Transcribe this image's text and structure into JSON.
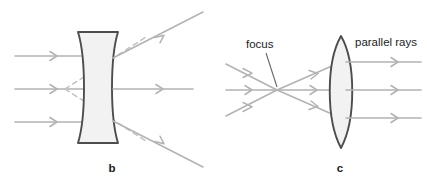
{
  "figure": {
    "width": 427,
    "height": 183,
    "background": "#ffffff"
  },
  "colors": {
    "ray": "#b3b3b3",
    "virtual_ray": "#c2c2c2",
    "lens_outline": "#4d4d4d",
    "lens_fill": "#f2f2f2",
    "leader": "#666666",
    "text": "#222222"
  },
  "panels": [
    {
      "id": "b",
      "letter": "b",
      "letter_x": 112,
      "letter_y": 172,
      "lens_type": "concave-diverging",
      "description": "Parallel rays entering a concave (diverging) lens spread apart; dashed virtual rays trace back to a virtual focus on the incoming side.",
      "labels": [],
      "incoming_rays": [
        {
          "name": "top-incoming-ray",
          "x1": 15,
          "y1": 56,
          "x2": 81,
          "y2": 56,
          "arrow_at": 55
        },
        {
          "name": "middle-incoming-ray",
          "x1": 15,
          "y1": 89,
          "x2": 87,
          "y2": 89,
          "arrow_at": 55
        },
        {
          "name": "bottom-incoming-ray",
          "x1": 15,
          "y1": 122,
          "x2": 81,
          "y2": 122,
          "arrow_at": 55
        }
      ],
      "outgoing_rays": [
        {
          "name": "top-diverging-ray",
          "x1": 115,
          "y1": 57,
          "x2": 202,
          "y2": 12,
          "arrow_at": 0.55
        },
        {
          "name": "middle-straight-ray",
          "x1": 115,
          "y1": 89,
          "x2": 192,
          "y2": 89,
          "arrow_at": 0.62
        },
        {
          "name": "bottom-diverging-ray",
          "x1": 115,
          "y1": 122,
          "x2": 202,
          "y2": 166,
          "arrow_at": 0.55
        }
      ],
      "virtual_rays": [
        {
          "name": "top-virtual-ray",
          "x1": 65,
          "y1": 89,
          "x2": 117,
          "y2": 56
        },
        {
          "name": "bottom-virtual-ray",
          "x1": 65,
          "y1": 89,
          "x2": 117,
          "y2": 122
        }
      ],
      "virtual_focus": {
        "x": 65,
        "y": 89
      }
    },
    {
      "id": "c",
      "letter": "c",
      "letter_x": 340,
      "letter_y": 172,
      "lens_type": "convex-converging",
      "description": "Rays emerging from a focus point pass through a convex (converging) lens and exit as parallel rays.",
      "labels": [
        {
          "name": "focus-label",
          "text": "focus",
          "x": 246,
          "y": 48,
          "leader": {
            "x1": 266,
            "y1": 53,
            "x2": 277,
            "y2": 86
          }
        },
        {
          "name": "parallel-rays-label",
          "text": "parallel rays",
          "x": 355,
          "y": 46,
          "leader": null
        }
      ],
      "focus_point": {
        "x": 277,
        "y": 90
      },
      "incoming_rays": [
        {
          "name": "top-incoming-ray",
          "x1": 226,
          "y1": 64,
          "x2": 277,
          "y2": 90,
          "arrow_at": 0.55
        },
        {
          "name": "middle-incoming-ray",
          "x1": 226,
          "y1": 90,
          "x2": 277,
          "y2": 90,
          "arrow_at": 0.55
        },
        {
          "name": "bottom-incoming-ray",
          "x1": 226,
          "y1": 116,
          "x2": 277,
          "y2": 90,
          "arrow_at": 0.55
        }
      ],
      "diverging_rays": [
        {
          "name": "upper-diverging-ray",
          "x1": 277,
          "y1": 90,
          "x2": 333,
          "y2": 62,
          "arrow_at": 0.72
        },
        {
          "name": "center-diverging-ray",
          "x1": 277,
          "y1": 90,
          "x2": 333,
          "y2": 90,
          "arrow_at": 0.72
        },
        {
          "name": "lower-diverging-ray",
          "x1": 277,
          "y1": 90,
          "x2": 333,
          "y2": 118,
          "arrow_at": 0.72
        }
      ],
      "outgoing_rays": [
        {
          "name": "top-parallel-ray",
          "x1": 341,
          "y1": 62,
          "x2": 420,
          "y2": 62,
          "arrow_at": 0.75
        },
        {
          "name": "middle-parallel-ray",
          "x1": 341,
          "y1": 90,
          "x2": 420,
          "y2": 90,
          "arrow_at": 0.75
        },
        {
          "name": "bottom-parallel-ray",
          "x1": 341,
          "y1": 118,
          "x2": 420,
          "y2": 118,
          "arrow_at": 0.75
        }
      ]
    }
  ]
}
